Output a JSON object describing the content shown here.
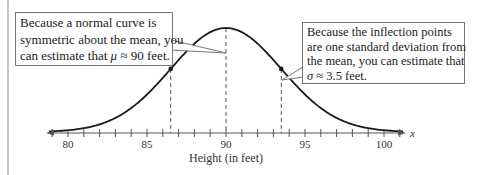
{
  "chart_data": {
    "type": "line",
    "title": "",
    "xlabel": "Height (in feet)",
    "ylabel": "",
    "axis_variable": "x",
    "xlim": [
      79,
      101
    ],
    "x_ticks": [
      80,
      85,
      90,
      95,
      100
    ],
    "minor_tick_step": 1,
    "grid": false,
    "legend": null,
    "series": [
      {
        "name": "normal curve",
        "distribution": "normal",
        "mean": 90,
        "std": 3.5
      }
    ],
    "reference_lines": [
      {
        "x": 86.5,
        "style": "dashed",
        "label": "inflection point (mean - 1 sd)"
      },
      {
        "x": 90,
        "style": "dashed",
        "label": "mean"
      },
      {
        "x": 93.5,
        "style": "dashed",
        "label": "inflection point (mean + 1 sd)"
      }
    ],
    "points": [
      {
        "x": 86.5,
        "label": "inflection point"
      },
      {
        "x": 93.5,
        "label": "inflection point"
      }
    ],
    "annotations": [
      {
        "id": "mean-callout",
        "lines": [
          "Because a normal curve is",
          "symmetric about the mean, you",
          "can estimate that"
        ],
        "symbol": "μ",
        "tail": " ≈ 90 feet.",
        "points_to": 90
      },
      {
        "id": "sd-callout",
        "lines": [
          "Because the inflection points",
          "are one standard deviation from",
          "the mean, you can estimate that"
        ],
        "symbol": "σ",
        "tail": " ≈ 3.5 feet.",
        "points_to": 93.5
      }
    ]
  },
  "labels": {
    "tick_80": "80",
    "tick_85": "85",
    "tick_90": "90",
    "tick_95": "95",
    "tick_100": "100",
    "axis_var": "x",
    "xlabel": "Height (in feet)"
  },
  "callouts": {
    "mean": {
      "line1": "Because a normal curve is",
      "line2": "symmetric about the mean, you",
      "line3_pre": "can estimate that ",
      "symbol": "μ",
      "line3_post": " ≈ 90 feet."
    },
    "sd": {
      "line1": "Because the inflection points",
      "line2": "are one standard deviation from",
      "line3": "the mean, you can estimate that",
      "symbol": "σ",
      "line4_post": " ≈ 3.5 feet."
    }
  },
  "colors": {
    "curve": "#1a1a1a",
    "axis": "#555555",
    "dashed": "#555555",
    "box_border": "#777777",
    "left_bar": "#c8c8c8"
  }
}
